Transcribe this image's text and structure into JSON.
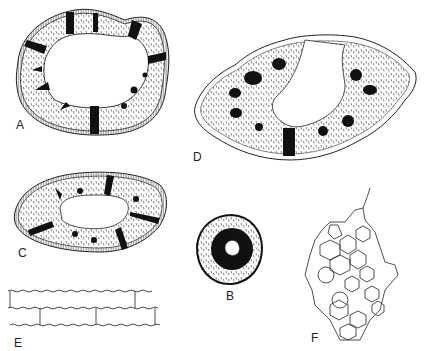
{
  "figure": {
    "type": "botanical line illustration",
    "panels": [
      {
        "id": "A",
        "label": "A",
        "description": "transverse section, hollow stem with radial dark bands"
      },
      {
        "id": "B",
        "label": "B",
        "description": "small circular section with dark central ring"
      },
      {
        "id": "C",
        "label": "C",
        "description": "elliptical hollow stem section with radial bands"
      },
      {
        "id": "D",
        "label": "D",
        "description": "large section with outer epidermal cells and vascular bundles"
      },
      {
        "id": "E",
        "label": "E",
        "description": "epidermal cells with sinuous walls"
      },
      {
        "id": "F",
        "label": "F",
        "description": "cellular tissue network"
      }
    ]
  }
}
